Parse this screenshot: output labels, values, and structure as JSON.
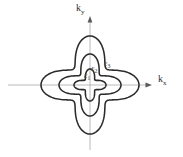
{
  "figure": {
    "background_color": "#ffffff",
    "contour_color": "#2b2b2b",
    "axis_color": "#a8a8a8",
    "label_color": "#4a4a4a",
    "center": {
      "x": 90,
      "y": 85
    },
    "axes": {
      "x_label": {
        "base": "k",
        "sub": "x"
      },
      "y_label": {
        "base": "k",
        "sub": "y"
      }
    },
    "contours": [
      {
        "label_base": "ε",
        "label_sub": "1",
        "tip_radius": 16,
        "waist_radius": 7
      },
      {
        "label_base": "ε",
        "label_sub": "2",
        "tip_radius": 31,
        "waist_radius": 14
      },
      {
        "label_base": "ε",
        "label_sub": "3",
        "tip_radius": 49,
        "waist_radius": 23
      }
    ]
  }
}
